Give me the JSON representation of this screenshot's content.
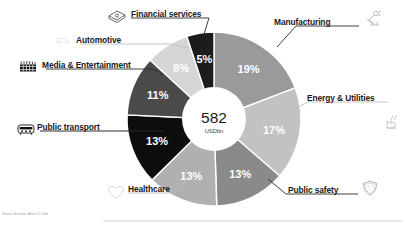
{
  "chart_data": {
    "type": "pie",
    "variant": "donut",
    "title": "",
    "center_value": "582",
    "center_unit": "USDbn",
    "unit_suffix": "%",
    "start_angle_deg": 0,
    "direction": "clockwise",
    "categories": [
      "Manufacturing",
      "Energy & Utilities",
      "Public safety",
      "Healthcare",
      "Public transport",
      "Media & Entertainment",
      "Automotive",
      "Financial services"
    ],
    "values": [
      19,
      17,
      13,
      13,
      13,
      11,
      8,
      5
    ],
    "labels": [
      "19%",
      "17%",
      "13%",
      "13%",
      "13%",
      "11%",
      "8%",
      "5%"
    ],
    "colors": [
      "#9a9a9a",
      "#c2c2c2",
      "#8a8a8a",
      "#b0b0b0",
      "#0d0d0d",
      "#4a4a4a",
      "#d6d6d6",
      "#1c1c1c"
    ],
    "label_text_colors": [
      "#ffffff",
      "#ffffff",
      "#ffffff",
      "#ffffff",
      "#ffffff",
      "#ffffff",
      "#ffffff",
      "#ffffff"
    ],
    "icons": [
      "robot-arm-icon",
      "power-plant-icon",
      "shield-icon",
      "heart-icon",
      "tram-icon",
      "film-strip-icon",
      "car-icon",
      "money-stack-icon"
    ],
    "legend": "callout-labels",
    "grid": false
  },
  "callouts": {
    "financial_services": "Financial services",
    "manufacturing": "Manufacturing",
    "automotive": "Automotive",
    "media_entertainment": "Media & Entertainment",
    "energy_utilities": "Energy & Utilities",
    "public_transport": "Public transport",
    "public_safety": "Public safety",
    "healthcare": "Healthcare"
  },
  "center": {
    "value": "582",
    "unit": "USDbn"
  },
  "footer": {
    "source": "Source: Ericsson, Arthur D. Little"
  }
}
